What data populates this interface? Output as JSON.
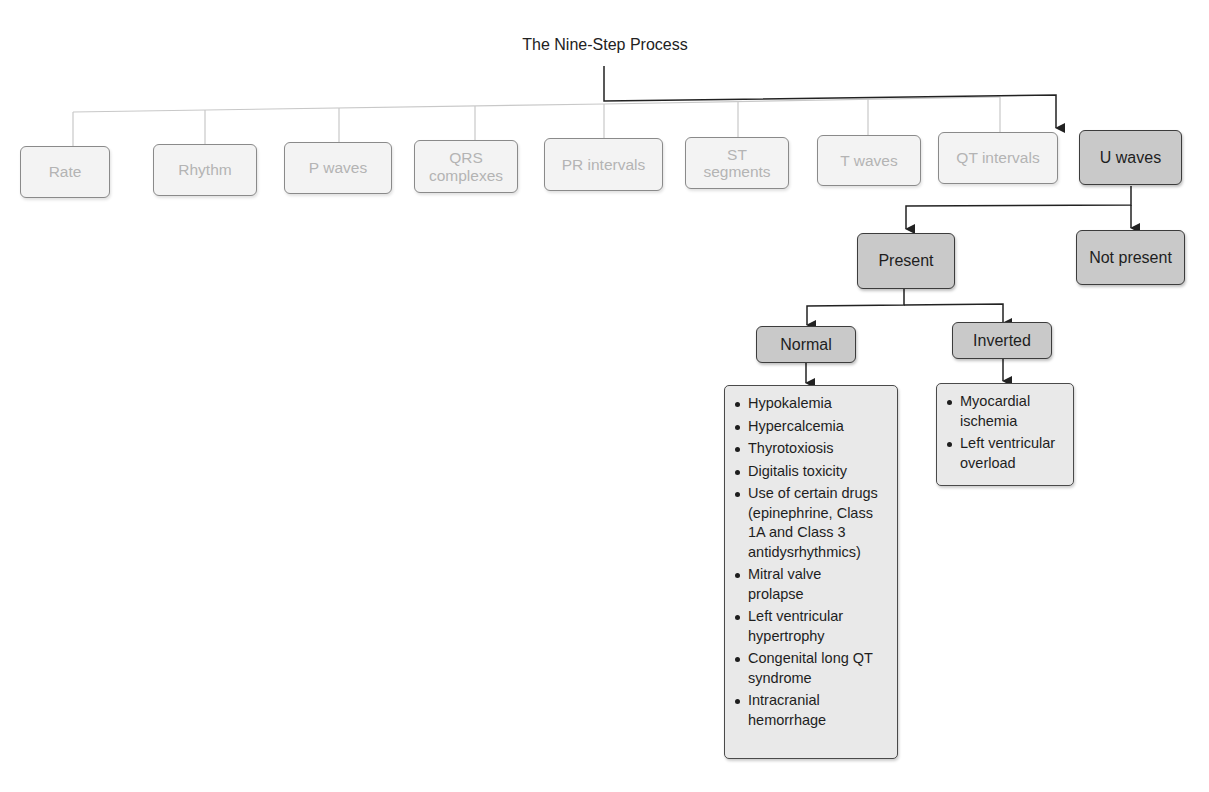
{
  "title": "The Nine-Step Process",
  "steps": [
    {
      "label": "Rate"
    },
    {
      "label": "Rhythm"
    },
    {
      "label": "P waves"
    },
    {
      "label": "QRS complexes"
    },
    {
      "label": "PR intervals"
    },
    {
      "label": "ST segments"
    },
    {
      "label": "T waves"
    },
    {
      "label": "QT intervals"
    },
    {
      "label": "U waves"
    }
  ],
  "branches": {
    "present": "Present",
    "not_present": "Not present",
    "normal": "Normal",
    "inverted": "Inverted"
  },
  "normal_causes": [
    "Hypokalemia",
    "Hypercalcemia",
    "Thyrotoxiosis",
    "Digitalis toxicity",
    "Use of certain drugs (epinephrine, Class 1A and Class 3 antidysrhythmics)",
    "Mitral valve prolapse",
    "Left ventricular hypertrophy",
    "Congenital long QT syndrome",
    "Intracranial hemorrhage"
  ],
  "inverted_causes": [
    "Myocardial ischemia",
    "Left ventricular overload"
  ],
  "colors": {
    "active_fill": "#c9c9c9",
    "faded_fill": "#f3f3f3",
    "faded_text": "#b4b4b4",
    "line": "#222222",
    "faded_line": "#c8c8c8"
  }
}
